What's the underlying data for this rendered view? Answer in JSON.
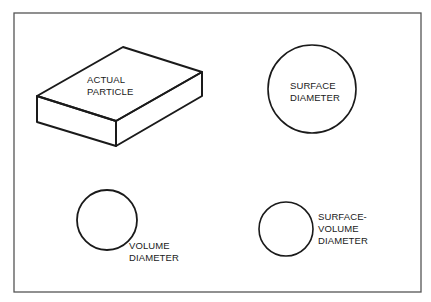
{
  "diagram": {
    "colors": {
      "background": "#ffffff",
      "frame": "#555555",
      "stroke": "#1a1a1a",
      "text": "#1a1a1a"
    },
    "shapes": [
      {
        "id": "actual-particle",
        "type": "rectangular-box",
        "label_lines": [
          "ACTUAL",
          "PARTICLE"
        ]
      },
      {
        "id": "surface-diameter",
        "type": "circle",
        "label_lines": [
          "SURFACE",
          "DIAMETER"
        ]
      },
      {
        "id": "volume-diameter",
        "type": "circle",
        "label_lines": [
          "VOLUME",
          "DIAMETER"
        ]
      },
      {
        "id": "surface-volume-diameter",
        "type": "circle",
        "label_lines": [
          "SURFACE-",
          "VOLUME",
          "DIAMETER"
        ]
      }
    ]
  }
}
